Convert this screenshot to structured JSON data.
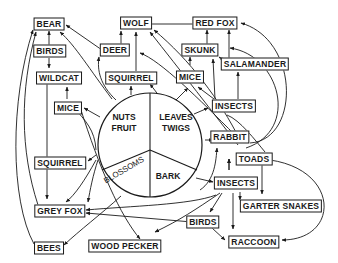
{
  "diagram": {
    "type": "food-web",
    "center": {
      "segments": [
        {
          "id": "nuts_fruit",
          "line1": "NUTS",
          "line2": "FRUIT"
        },
        {
          "id": "leaves_twigs",
          "line1": "LEAVES",
          "line2": "TWIGS"
        },
        {
          "id": "blossoms",
          "line1": "BLOSSOMS"
        },
        {
          "id": "bark",
          "line1": "BARK"
        }
      ]
    },
    "nodes": [
      {
        "id": "bear",
        "label": "BEAR"
      },
      {
        "id": "wolf",
        "label": "WOLF"
      },
      {
        "id": "red_fox",
        "label": "RED FOX"
      },
      {
        "id": "birds_top",
        "label": "BIRDS"
      },
      {
        "id": "deer",
        "label": "DEER"
      },
      {
        "id": "skunk",
        "label": "SKUNK"
      },
      {
        "id": "salamander",
        "label": "SALAMANDER"
      },
      {
        "id": "wildcat",
        "label": "WILDCAT"
      },
      {
        "id": "squirrel_top",
        "label": "SQUIRREL"
      },
      {
        "id": "mice_right",
        "label": "MICE"
      },
      {
        "id": "mice_left",
        "label": "MICE"
      },
      {
        "id": "insects_top",
        "label": "INSECTS"
      },
      {
        "id": "rabbit",
        "label": "RABBIT"
      },
      {
        "id": "squirrel_left",
        "label": "SQUIRREL"
      },
      {
        "id": "toads",
        "label": "TOADS"
      },
      {
        "id": "insects_bottom",
        "label": "INSECTS"
      },
      {
        "id": "garter_snakes",
        "label": "GARTER SNAKES"
      },
      {
        "id": "grey_fox",
        "label": "GREY FOX"
      },
      {
        "id": "birds_bottom",
        "label": "BIRDS"
      },
      {
        "id": "bees",
        "label": "BEES"
      },
      {
        "id": "wood_pecker",
        "label": "WOOD PECKER"
      },
      {
        "id": "raccoon",
        "label": "RACCOON"
      }
    ],
    "edges": [
      {
        "from": "birds_top",
        "to": "bear"
      },
      {
        "from": "birds_top",
        "to": "wildcat"
      },
      {
        "from": "deer",
        "to": "bear"
      },
      {
        "from": "deer",
        "to": "wolf"
      },
      {
        "from": "squirrel_top",
        "to": "wolf"
      },
      {
        "from": "mice_left",
        "to": "wildcat"
      },
      {
        "from": "nuts_fruit",
        "to": "bear"
      },
      {
        "from": "nuts_fruit",
        "to": "deer"
      },
      {
        "from": "nuts_fruit",
        "to": "squirrel_top"
      },
      {
        "from": "nuts_fruit",
        "to": "mice_left"
      },
      {
        "from": "nuts_fruit",
        "to": "squirrel_left"
      },
      {
        "from": "leaves_twigs",
        "to": "squirrel_top"
      },
      {
        "from": "leaves_twigs",
        "to": "mice_right"
      },
      {
        "from": "leaves_twigs",
        "to": "insects_top"
      },
      {
        "from": "leaves_twigs",
        "to": "rabbit"
      },
      {
        "from": "red_fox",
        "to": "wolf"
      },
      {
        "from": "skunk",
        "to": "red_fox"
      },
      {
        "from": "salamander",
        "to": "red_fox"
      },
      {
        "from": "salamander",
        "to": "skunk"
      },
      {
        "from": "mice_right",
        "to": "skunk"
      },
      {
        "from": "insects_top",
        "to": "mice_right"
      },
      {
        "from": "insects_top",
        "to": "skunk"
      },
      {
        "from": "insects_top",
        "to": "salamander"
      },
      {
        "from": "rabbit",
        "to": "red_fox"
      },
      {
        "from": "rabbit",
        "to": "skunk"
      },
      {
        "from": "rabbit",
        "to": "wolf"
      },
      {
        "from": "toads",
        "to": "insects_bottom"
      },
      {
        "from": "insects_bottom",
        "to": "toads"
      },
      {
        "from": "toads",
        "to": "garter_snakes"
      },
      {
        "from": "toads",
        "to": "raccoon"
      },
      {
        "from": "insects_bottom",
        "to": "garter_snakes"
      },
      {
        "from": "insects_bottom",
        "to": "raccoon"
      },
      {
        "from": "insects_bottom",
        "to": "birds_bottom"
      },
      {
        "from": "insects_bottom",
        "to": "wood_pecker"
      },
      {
        "from": "insects_bottom",
        "to": "grey_fox"
      },
      {
        "from": "birds_bottom",
        "to": "raccoon"
      },
      {
        "from": "birds_bottom",
        "to": "grey_fox"
      },
      {
        "from": "bark",
        "to": "insects_bottom"
      },
      {
        "from": "bark",
        "to": "rabbit"
      },
      {
        "from": "blossoms",
        "to": "bees"
      },
      {
        "from": "blossoms",
        "to": "grey_fox"
      },
      {
        "from": "squirrel_left",
        "to": "grey_fox"
      },
      {
        "from": "wildcat",
        "to": "grey_fox"
      },
      {
        "from": "bees",
        "to": "bear"
      },
      {
        "from": "grey_fox",
        "to": "bear"
      },
      {
        "from": "mice_left",
        "to": "wood_pecker"
      }
    ]
  }
}
